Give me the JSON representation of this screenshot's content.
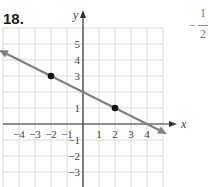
{
  "problem": {
    "number": "18."
  },
  "answer": {
    "sign": "−",
    "numerator": "1",
    "denominator": "2"
  },
  "chart_data": {
    "type": "line",
    "title": "",
    "xlabel": "x",
    "ylabel": "y",
    "xlim": [
      -5,
      5
    ],
    "ylim": [
      -4,
      6
    ],
    "grid": true,
    "x_ticks": [
      "−4",
      "−3",
      "−2",
      "−1",
      "1",
      "2",
      "3",
      "4"
    ],
    "y_ticks": [
      "5",
      "4",
      "3",
      "1",
      "−1",
      "−2",
      "−3"
    ],
    "series": [
      {
        "name": "line",
        "x": [
          -5,
          5
        ],
        "y": [
          4.5,
          -0.5
        ],
        "arrows": "both",
        "color": "#808080"
      }
    ],
    "points": [
      {
        "x": -2,
        "y": 3
      },
      {
        "x": 2,
        "y": 1
      }
    ],
    "slope": "-1/2"
  }
}
